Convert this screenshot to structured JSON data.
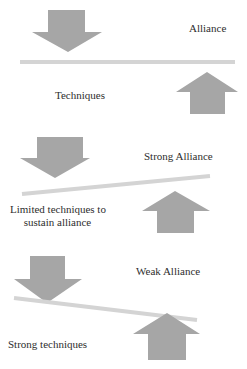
{
  "colors": {
    "arrow": "#a6a6a6",
    "beam": "#d4d4d4",
    "text": "#2e2e2e",
    "background": "#ffffff"
  },
  "panels": [
    {
      "id": "balanced",
      "top_label": "Alliance",
      "bottom_label": "Techniques",
      "beam": "level"
    },
    {
      "id": "strong-alliance",
      "top_label": "Strong Alliance",
      "bottom_label_line1": "Limited techniques to",
      "bottom_label_line2": "sustain alliance",
      "beam": "tilted-up-right"
    },
    {
      "id": "weak-alliance",
      "top_label": "Weak Alliance",
      "bottom_label": "Strong techniques",
      "beam": "tilted-down-right"
    }
  ],
  "icons": {
    "down": "arrow-down-icon",
    "up": "arrow-up-icon"
  }
}
